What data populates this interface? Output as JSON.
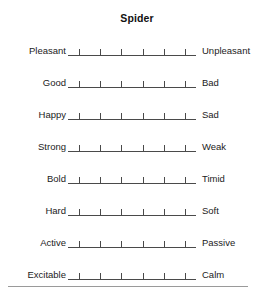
{
  "chart_data": {
    "type": "table",
    "title": "Spider",
    "subtitle": "",
    "xlabel": "",
    "ylabel": "",
    "scale_points": 6,
    "grid": false,
    "legend": "none",
    "categories": [
      "Pleasant-Unpleasant",
      "Good-Bad",
      "Happy-Sad",
      "Strong-Weak",
      "Bold-Timid",
      "Hard-Soft",
      "Active-Passive",
      "Excitable-Calm"
    ],
    "items": [
      {
        "left": "Pleasant",
        "right": "Unpleasant",
        "ticks": 6,
        "value": null
      },
      {
        "left": "Good",
        "right": "Bad",
        "ticks": 6,
        "value": null
      },
      {
        "left": "Happy",
        "right": "Sad",
        "ticks": 6,
        "value": null
      },
      {
        "left": "Strong",
        "right": "Weak",
        "ticks": 6,
        "value": null
      },
      {
        "left": "Bold",
        "right": "Timid",
        "ticks": 6,
        "value": null
      },
      {
        "left": "Hard",
        "right": "Soft",
        "ticks": 6,
        "value": null
      },
      {
        "left": "Active",
        "right": "Passive",
        "ticks": 6,
        "value": null
      },
      {
        "left": "Excitable",
        "right": "Calm",
        "ticks": 6,
        "value": null
      }
    ],
    "colors": {
      "text": "#1b1b1b",
      "axis": "#4a4a4a",
      "rule": "#9a9a9a",
      "background": "#ffffff"
    }
  }
}
